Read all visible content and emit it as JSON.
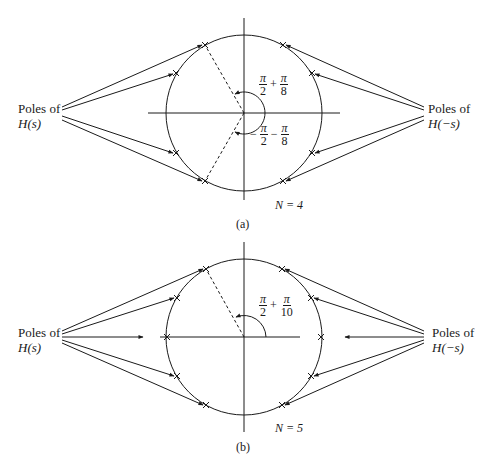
{
  "figure": {
    "panels": [
      {
        "id": "a",
        "caption": "(a)",
        "order_label": "N = 4",
        "order_var": "N",
        "order_value": "4",
        "left_label_line1": "Poles of",
        "left_label_line2": "H(s)",
        "right_label_line1": "Poles of",
        "right_label_line2": "H(−s)",
        "angle_upper": {
          "sign": "",
          "a_num": "π",
          "a_den": "2",
          "op": "+",
          "b_num": "π",
          "b_den": "8"
        },
        "angle_lower": {
          "sign": "−",
          "a_num": "π",
          "a_den": "2",
          "op": "−",
          "b_num": "π",
          "b_den": "8"
        },
        "pole_angles_deg": [
          112.5,
          157.5,
          202.5,
          247.5,
          67.5,
          22.5,
          -22.5,
          -67.5
        ]
      },
      {
        "id": "b",
        "caption": "(b)",
        "order_label": "N = 5",
        "order_var": "N",
        "order_value": "5",
        "left_label_line1": "Poles of",
        "left_label_line2": "H(s)",
        "right_label_line1": "Poles of",
        "right_label_line2": "H(−s)",
        "angle_upper": {
          "sign": "",
          "a_num": "π",
          "a_den": "2",
          "op": "+",
          "b_num": "π",
          "b_den": "10"
        },
        "pole_angles_deg": [
          108,
          144,
          180,
          216,
          252,
          72,
          36,
          0,
          -36,
          -72
        ]
      }
    ]
  }
}
